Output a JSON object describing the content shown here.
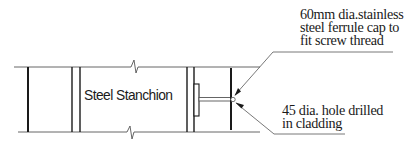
{
  "diagram": {
    "type": "construction-detail",
    "colors": {
      "ink": "#1a1a1a",
      "thin_line": "#555555",
      "background": "#ffffff"
    },
    "labels": {
      "stanchion": "Steel Stanchion",
      "ferrule_note": {
        "lines": [
          "60mm dia.stainless",
          "steel ferrule cap to",
          "fit screw thread"
        ]
      },
      "hole_note": {
        "lines": [
          "45 dia. hole drilled",
          "in cladding"
        ]
      }
    },
    "components": [
      {
        "name": "steel-stanchion",
        "label_ref": "labels.stanchion"
      },
      {
        "name": "ferrule-cap",
        "label_ref": "labels.ferrule_note"
      },
      {
        "name": "cladding-hole",
        "label_ref": "labels.hole_note"
      },
      {
        "name": "break-line-top"
      },
      {
        "name": "break-line-bottom"
      }
    ]
  }
}
